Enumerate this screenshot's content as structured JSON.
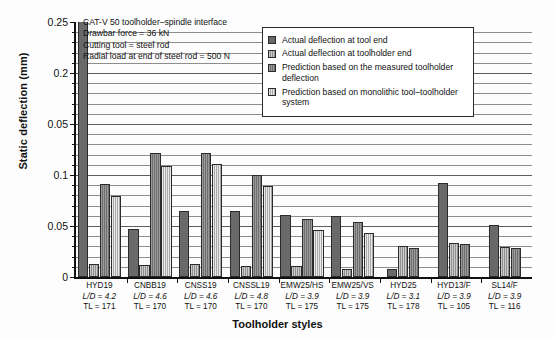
{
  "chart_data": {
    "type": "bar",
    "title": "",
    "xlabel": "Toolholder styles",
    "ylabel": "Static deflection (mm)",
    "ylim": [
      0,
      0.25
    ],
    "grid": true,
    "legend_position": "top-right",
    "ytick_labels": [
      "0.25",
      "0.2",
      "0.05",
      "0.1",
      "0.05",
      "0"
    ],
    "ytick_values": [
      0.25,
      0.2,
      0.15,
      0.1,
      0.05,
      0
    ],
    "minor_tick_step": 0.01,
    "categories": [
      "HYD19",
      "CNBB19",
      "CNSS19",
      "CNSSL19",
      "EMW25/HS",
      "EMW25/VS",
      "HYD25",
      "HYD13/F",
      "SL14/F"
    ],
    "category_sublabels": [
      {
        "ld": "L/D = 4.2",
        "tl": "TL = 171"
      },
      {
        "ld": "L/D = 4.6",
        "tl": "TL = 170"
      },
      {
        "ld": "L/D = 4.6",
        "tl": "TL = 170"
      },
      {
        "ld": "L/D = 4.8",
        "tl": "TL = 170"
      },
      {
        "ld": "L/D = 3.9",
        "tl": "TL = 175"
      },
      {
        "ld": "L/D = 3.9",
        "tl": "TL = 175"
      },
      {
        "ld": "L/D = 3.1",
        "tl": "TL = 178"
      },
      {
        "ld": "L/D = 3.9",
        "tl": "TL = 105"
      },
      {
        "ld": "L/D = 3.9",
        "tl": "TL = 116"
      }
    ],
    "series": [
      {
        "name": "Actual deflection at tool end",
        "color": "#696969",
        "values": [
          0.262,
          0.047,
          0.065,
          0.065,
          0.061,
          0.06,
          0.0075,
          0.092,
          0.051
        ],
        "clipped": [
          true,
          false,
          false,
          false,
          false,
          false,
          false,
          false,
          false
        ]
      },
      {
        "name": "Actual deflection at toolholder end",
        "color": "#8f8f8f",
        "values": [
          0.0125,
          0.012,
          0.0125,
          0.011,
          0.0105,
          0.0075,
          0.0305,
          0.0335,
          0.0295
        ]
      },
      {
        "name": "Prediction based on the measured toolholder deflection",
        "color": "#6f6f6f",
        "values": [
          0.091,
          0.122,
          0.122,
          0.1,
          0.057,
          0.054,
          0.0285,
          0.032,
          0.0285
        ]
      },
      {
        "name": "Prediction based on monolithic tool–toolholder system",
        "color": "#a9a9a9",
        "values": [
          0.079,
          0.109,
          0.111,
          0.089,
          0.046,
          0.043,
          null,
          null,
          null
        ]
      }
    ],
    "annotations": [
      "CAT-V 50 toolholder–spindle interface",
      "Drawbar force = 36 kN",
      "Cutting tool = steel rod",
      "Radial load at end of steel rod = 500 N"
    ]
  }
}
